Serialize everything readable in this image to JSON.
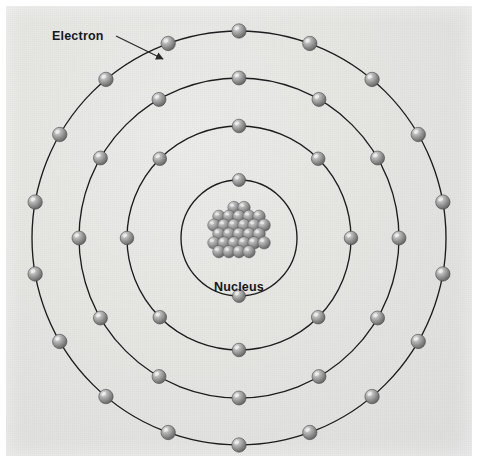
{
  "figure": {
    "kind": "bohr-atomic-model-diagram",
    "background_color": "#e6e6e3",
    "page_color": "#ffffff",
    "orbit_stroke_color": "#1d1d1d",
    "electron_color": "#8c8c8c",
    "label_color": "#17181a"
  },
  "labels": {
    "electron": "Electron",
    "nucleus": "Nucleus"
  },
  "callout": {
    "electron_leader": {
      "from_x": 116,
      "from_y": 36,
      "to_x": 163,
      "to_y": 59,
      "has_arrowhead": true
    }
  },
  "chart_data": {
    "type": "diagram",
    "center": {
      "x": 239,
      "y": 238
    },
    "nucleus": {
      "label": "Nucleus",
      "label_x": 239,
      "label_y": 280,
      "cluster_radius_px": 30,
      "nucleon_count": 28,
      "nucleon_radius_px": 6.2
    },
    "shells": [
      {
        "index": 1,
        "name": "shell-1",
        "radius": 58,
        "electron_count": 2,
        "start_angle_deg": -90,
        "electron_radius_px": 6.5
      },
      {
        "index": 2,
        "name": "shell-2",
        "radius": 112,
        "electron_count": 8,
        "start_angle_deg": -90,
        "electron_radius_px": 6.8
      },
      {
        "index": 3,
        "name": "shell-3",
        "radius": 160,
        "electron_count": 12,
        "start_angle_deg": -90,
        "electron_radius_px": 7.0
      },
      {
        "index": 4,
        "name": "shell-4",
        "radius": 207,
        "electron_count": 18,
        "start_angle_deg": -90,
        "electron_radius_px": 7.2
      }
    ],
    "electron_configuration": [
      2,
      8,
      12,
      18
    ],
    "total_electrons": 40,
    "legend": [],
    "grid": false
  }
}
